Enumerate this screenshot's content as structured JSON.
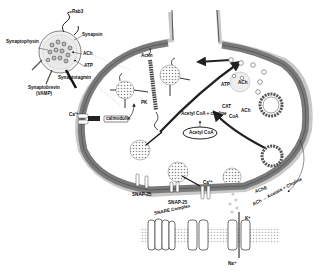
{
  "diagram": {
    "vesicle_inset_labels": {
      "rab3": "Rab3",
      "synaptophysin": "Synaptophysin",
      "synapsin": "Synapsin",
      "ach": "ACh",
      "atp": "ATP",
      "synaptotagmin": "Synaptotagmin",
      "synaptobrevin": "Synaptobrevin",
      "vamp": "(VAMP)"
    },
    "terminal_labels": {
      "actin": "Actin",
      "pk": "PK",
      "ca_left": "Ca²⁺",
      "calmodulin": "calmodulin",
      "atp_right": "ATP",
      "ach_right": "ACh",
      "coa": "CoA",
      "synthesis": "Acetyl CoA + choline",
      "cat": "CAT",
      "ach_arrow": "ACh",
      "acetyl_coa_box": "Acetyl CoA",
      "snap25_a": "SNAP-25",
      "snap25_b": "SNAP-25",
      "snare": "SNARE Complex",
      "ca_bottom": "Ca²⁺",
      "ache": "AChE",
      "hydrolysis": "ACh → Acetate + Choline",
      "k_ion": "K⁺",
      "na_ion": "Na⁺"
    }
  }
}
